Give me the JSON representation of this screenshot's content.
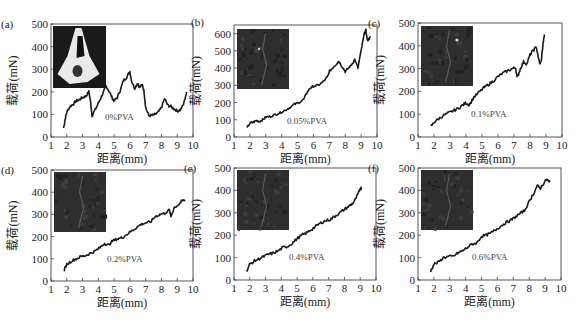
{
  "figure": {
    "xlabel": "距离(mm)",
    "ylabel": "载荷(mN)"
  },
  "chart_data": [
    {
      "type": "line",
      "panel": "(a)",
      "annotation": "0%PVA",
      "xlabel": "距离(mm)",
      "ylabel": "载荷(mN)",
      "xlim": [
        1,
        10
      ],
      "ylim": [
        0,
        500
      ],
      "xticks": [
        1,
        2,
        3,
        4,
        5,
        6,
        7,
        8,
        9,
        10
      ],
      "yticks": [
        0,
        100,
        200,
        300,
        400,
        500
      ],
      "box": {
        "left": 51,
        "right": 193,
        "top": 24,
        "bottom": 137
      },
      "inset": {
        "x": 53,
        "y": 26,
        "w": 53,
        "h": 62,
        "style": "bright"
      },
      "ann_pos": {
        "x": 105,
        "y": 120
      },
      "x": [
        1.8,
        1.9,
        2.0,
        2.2,
        2.4,
        2.6,
        2.8,
        3.0,
        3.2,
        3.4,
        3.5,
        3.6,
        3.8,
        4.0,
        4.2,
        4.4,
        4.5,
        4.7,
        4.9,
        5.0,
        5.2,
        5.4,
        5.6,
        5.8,
        6.0,
        6.1,
        6.3,
        6.5,
        6.6,
        6.8,
        6.9,
        7.0,
        7.2,
        7.4,
        7.6,
        7.8,
        8.0,
        8.2,
        8.4,
        8.6,
        8.8,
        9.0,
        9.2,
        9.4,
        9.6
      ],
      "y": [
        40,
        80,
        110,
        135,
        145,
        160,
        165,
        175,
        180,
        200,
        160,
        95,
        120,
        150,
        180,
        210,
        225,
        200,
        170,
        160,
        175,
        210,
        250,
        265,
        290,
        250,
        215,
        240,
        220,
        230,
        200,
        130,
        95,
        95,
        100,
        110,
        130,
        170,
        140,
        135,
        125,
        115,
        120,
        145,
        200
      ]
    },
    {
      "type": "line",
      "panel": "(b)",
      "annotation": "0.05%PVA",
      "xlabel": "距离(mm)",
      "ylabel": "载荷(mN)",
      "xlim": [
        1,
        10
      ],
      "ylim": [
        0,
        650
      ],
      "xticks": [
        1,
        2,
        3,
        4,
        5,
        6,
        7,
        8,
        9,
        10
      ],
      "yticks": [
        0,
        100,
        200,
        300,
        400,
        500,
        600
      ],
      "box": {
        "left": 234,
        "right": 377,
        "top": 25,
        "bottom": 137
      },
      "inset": {
        "x": 237,
        "y": 29,
        "w": 52,
        "h": 60,
        "style": "dark"
      },
      "ann_pos": {
        "x": 287,
        "y": 124
      },
      "x": [
        1.8,
        2.0,
        2.2,
        2.4,
        2.6,
        2.8,
        3.0,
        3.3,
        3.6,
        3.9,
        4.2,
        4.5,
        4.8,
        5.1,
        5.4,
        5.6,
        5.8,
        6.0,
        6.3,
        6.6,
        6.9,
        7.0,
        7.2,
        7.4,
        7.6,
        7.8,
        8.0,
        8.2,
        8.4,
        8.6,
        8.8,
        9.0,
        9.2,
        9.3,
        9.4,
        9.5,
        9.6
      ],
      "y": [
        50,
        80,
        85,
        95,
        90,
        100,
        115,
        120,
        130,
        140,
        155,
        170,
        190,
        200,
        220,
        260,
        285,
        295,
        300,
        320,
        350,
        380,
        400,
        420,
        440,
        410,
        380,
        400,
        420,
        450,
        400,
        500,
        600,
        620,
        560,
        570,
        580
      ]
    },
    {
      "type": "line",
      "panel": "(c)",
      "annotation": "0.1%PVA",
      "xlabel": "距离(mm)",
      "ylabel": "载荷(mN)",
      "xlim": [
        1,
        10
      ],
      "ylim": [
        0,
        500
      ],
      "xticks": [
        1,
        2,
        3,
        4,
        5,
        6,
        7,
        8,
        9,
        10
      ],
      "yticks": [
        0,
        100,
        200,
        300,
        400,
        500
      ],
      "box": {
        "left": 418,
        "right": 562,
        "top": 23,
        "bottom": 137
      },
      "inset": {
        "x": 421,
        "y": 26,
        "w": 52,
        "h": 60,
        "style": "dark"
      },
      "ann_pos": {
        "x": 471,
        "y": 117
      },
      "x": [
        1.8,
        2.0,
        2.3,
        2.6,
        2.9,
        3.2,
        3.5,
        3.8,
        4.0,
        4.2,
        4.5,
        4.8,
        5.1,
        5.4,
        5.7,
        6.0,
        6.3,
        6.6,
        6.9,
        7.1,
        7.2,
        7.4,
        7.6,
        7.8,
        8.0,
        8.2,
        8.4,
        8.6,
        8.7,
        8.8,
        8.9
      ],
      "y": [
        45,
        65,
        80,
        95,
        105,
        115,
        125,
        140,
        150,
        140,
        175,
        195,
        215,
        230,
        245,
        265,
        280,
        290,
        300,
        305,
        260,
        300,
        330,
        320,
        360,
        380,
        395,
        320,
        330,
        400,
        450
      ]
    },
    {
      "type": "line",
      "panel": "(d)",
      "annotation": "0.2%PVA",
      "xlabel": "距离(mm)",
      "ylabel": "载荷(mN)",
      "xlim": [
        1,
        10
      ],
      "ylim": [
        0,
        500
      ],
      "xticks": [
        1,
        2,
        3,
        4,
        5,
        6,
        7,
        8,
        9,
        10
      ],
      "yticks": [
        0,
        100,
        200,
        300,
        400,
        500
      ],
      "box": {
        "left": 51,
        "right": 193,
        "top": 170,
        "bottom": 281
      },
      "inset": {
        "x": 54,
        "y": 172,
        "w": 52,
        "h": 60,
        "style": "dark"
      },
      "ann_pos": {
        "x": 107,
        "y": 262
      },
      "x": [
        1.8,
        2.0,
        2.3,
        2.6,
        2.9,
        3.2,
        3.5,
        3.8,
        4.1,
        4.4,
        4.6,
        4.9,
        5.2,
        5.5,
        5.8,
        6.1,
        6.4,
        6.7,
        7.0,
        7.3,
        7.6,
        7.9,
        8.2,
        8.5,
        8.6,
        8.8,
        9.1,
        9.3,
        9.5
      ],
      "y": [
        45,
        75,
        90,
        100,
        110,
        115,
        125,
        135,
        150,
        170,
        160,
        180,
        190,
        195,
        210,
        225,
        240,
        255,
        262,
        265,
        290,
        300,
        305,
        320,
        290,
        330,
        345,
        360,
        365
      ]
    },
    {
      "type": "line",
      "panel": "(e)",
      "annotation": "0.4%PVA",
      "xlabel": "距离(mm)",
      "ylabel": "载荷(mN)",
      "xlim": [
        1,
        10
      ],
      "ylim": [
        0,
        500
      ],
      "xticks": [
        1,
        2,
        3,
        4,
        5,
        6,
        7,
        8,
        9,
        10
      ],
      "yticks": [
        0,
        100,
        200,
        300,
        400,
        500
      ],
      "box": {
        "left": 234,
        "right": 376,
        "top": 168,
        "bottom": 280
      },
      "inset": {
        "x": 237,
        "y": 170,
        "w": 52,
        "h": 60,
        "style": "dark"
      },
      "ann_pos": {
        "x": 289,
        "y": 260
      },
      "x": [
        1.8,
        2.0,
        2.3,
        2.6,
        2.9,
        3.2,
        3.5,
        3.8,
        4.1,
        4.4,
        4.7,
        5.0,
        5.3,
        5.6,
        5.9,
        6.2,
        6.5,
        6.8,
        7.1,
        7.4,
        7.7,
        8.0,
        8.3,
        8.5,
        8.7,
        8.9,
        9.0,
        9.1
      ],
      "y": [
        40,
        70,
        85,
        95,
        105,
        115,
        120,
        130,
        145,
        150,
        165,
        185,
        200,
        210,
        225,
        240,
        255,
        265,
        270,
        285,
        300,
        315,
        330,
        340,
        360,
        390,
        410,
        410
      ]
    },
    {
      "type": "line",
      "panel": "(f)",
      "annotation": "0.6%PVA",
      "xlabel": "距离(mm)",
      "ylabel": "载荷(mN)",
      "xlim": [
        1,
        10
      ],
      "ylim": [
        0,
        500
      ],
      "xticks": [
        1,
        2,
        3,
        4,
        5,
        6,
        7,
        8,
        9,
        10
      ],
      "yticks": [
        0,
        100,
        200,
        300,
        400,
        500
      ],
      "box": {
        "left": 418,
        "right": 561,
        "top": 168,
        "bottom": 280
      },
      "inset": {
        "x": 421,
        "y": 170,
        "w": 52,
        "h": 60,
        "style": "dark"
      },
      "ann_pos": {
        "x": 472,
        "y": 260
      },
      "x": [
        1.8,
        2.0,
        2.3,
        2.6,
        2.9,
        3.2,
        3.5,
        3.8,
        4.1,
        4.4,
        4.7,
        5.0,
        5.3,
        5.6,
        5.9,
        6.2,
        6.5,
        6.8,
        7.1,
        7.4,
        7.7,
        8.0,
        8.3,
        8.5,
        8.7,
        8.9,
        9.1,
        9.2,
        9.3
      ],
      "y": [
        40,
        70,
        80,
        100,
        105,
        105,
        120,
        130,
        145,
        160,
        165,
        195,
        200,
        210,
        225,
        240,
        255,
        265,
        280,
        295,
        310,
        350,
        390,
        420,
        410,
        430,
        450,
        440,
        445
      ]
    }
  ]
}
